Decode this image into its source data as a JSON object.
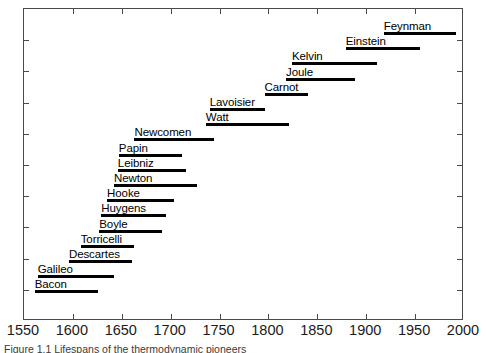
{
  "chart_data": {
    "type": "bar",
    "orientation": "horizontal",
    "title": "",
    "subtitle": "",
    "xlabel": "",
    "ylabel": "",
    "xlim": [
      1550,
      2000
    ],
    "xticks": [
      1550,
      1600,
      1650,
      1700,
      1750,
      1800,
      1850,
      1900,
      1950,
      2000
    ],
    "xtick_labels": [
      "1550",
      "1600",
      "1650",
      "1700",
      "1750",
      "1800",
      "1850",
      "1900",
      "1950",
      "2000"
    ],
    "grid": false,
    "legend": null,
    "bar_color": "#000000",
    "frame_color": "#4a4a4a",
    "categories": [
      "Feynman",
      "Einstein",
      "Kelvin",
      "Joule",
      "Carnot",
      "Lavoisier",
      "Watt",
      "Newcomen",
      "Papin",
      "Leibniz",
      "Newton",
      "Hooke",
      "Huygens",
      "Boyle",
      "Torricelli",
      "Descartes",
      "Galileo",
      "Bacon"
    ],
    "bars": [
      {
        "label": "Feynman",
        "start": 1918,
        "end": 1992,
        "row": 0
      },
      {
        "label": "Einstein",
        "start": 1879,
        "end": 1955,
        "row": 1
      },
      {
        "label": "Kelvin",
        "start": 1824,
        "end": 1911,
        "row": 2
      },
      {
        "label": "Joule",
        "start": 1818,
        "end": 1889,
        "row": 3
      },
      {
        "label": "Carnot",
        "start": 1796,
        "end": 1840,
        "row": 4
      },
      {
        "label": "Lavoisier",
        "start": 1740,
        "end": 1797,
        "row": 5
      },
      {
        "label": "Watt",
        "start": 1736,
        "end": 1821,
        "row": 6
      },
      {
        "label": "Newcomen",
        "start": 1663,
        "end": 1744,
        "row": 7
      },
      {
        "label": "Papin",
        "start": 1647,
        "end": 1712,
        "row": 8
      },
      {
        "label": "Leibniz",
        "start": 1646,
        "end": 1716,
        "row": 9
      },
      {
        "label": "Newton",
        "start": 1642,
        "end": 1727,
        "row": 10
      },
      {
        "label": "Hooke",
        "start": 1635,
        "end": 1703,
        "row": 11
      },
      {
        "label": "Huygens",
        "start": 1629,
        "end": 1695,
        "row": 12
      },
      {
        "label": "Boyle",
        "start": 1627,
        "end": 1691,
        "row": 13
      },
      {
        "label": "Torricelli",
        "start": 1608,
        "end": 1663,
        "row": 14
      },
      {
        "label": "Descartes",
        "start": 1596,
        "end": 1660,
        "row": 15
      },
      {
        "label": "Galileo",
        "start": 1564,
        "end": 1642,
        "row": 16
      },
      {
        "label": "Bacon",
        "start": 1561,
        "end": 1626,
        "row": 17
      }
    ]
  },
  "caption": {
    "text": "Figure 1.1   Lifespans of the thermodynamic pioneers"
  }
}
